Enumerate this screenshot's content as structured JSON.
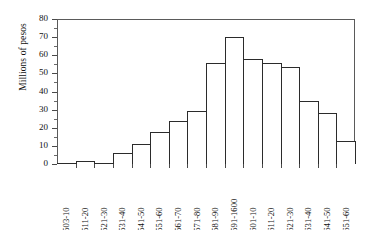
{
  "chart_data": {
    "type": "bar",
    "title": "",
    "subtitle": "",
    "xlabel": "",
    "ylabel": "Millions of pesos",
    "ylim": [
      0,
      80
    ],
    "ytick_values": [
      0,
      10,
      20,
      30,
      40,
      50,
      60,
      70,
      80
    ],
    "ytick_labels": [
      "0",
      "10",
      "20",
      "30",
      "40",
      "50",
      "60",
      "70",
      "80"
    ],
    "grid": false,
    "legend": null,
    "categories": [
      "1503-10",
      "1511-20",
      "1521-30",
      "1531-40",
      "1541-50",
      "1551-60",
      "1561-70",
      "1571-80",
      "1581-90",
      "1591-1600",
      "1601-10",
      "1611-20",
      "1621-30",
      "1631-40",
      "1641-50",
      "1651-60"
    ],
    "values": [
      0.4,
      1.5,
      0.8,
      6,
      11,
      17.5,
      24,
      29,
      55.5,
      70,
      58,
      55.5,
      53.5,
      35,
      28,
      12.5
    ],
    "annotations": []
  },
  "axes": {
    "y_title": "Millions of pesos"
  }
}
